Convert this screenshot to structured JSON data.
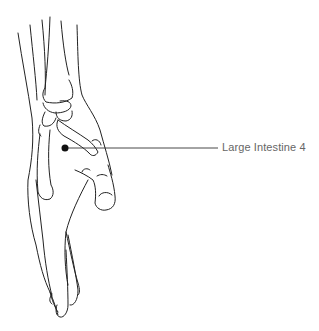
{
  "figure": {
    "point": {
      "x": 65,
      "y": 148,
      "color": "#111111"
    },
    "leader_line": {
      "x1": 65,
      "y1": 148,
      "x2": 218,
      "y2": 148,
      "color": "#333333"
    },
    "label": "Large Intestine 4",
    "label_color": "#666666",
    "stroke_color": "#222222"
  }
}
